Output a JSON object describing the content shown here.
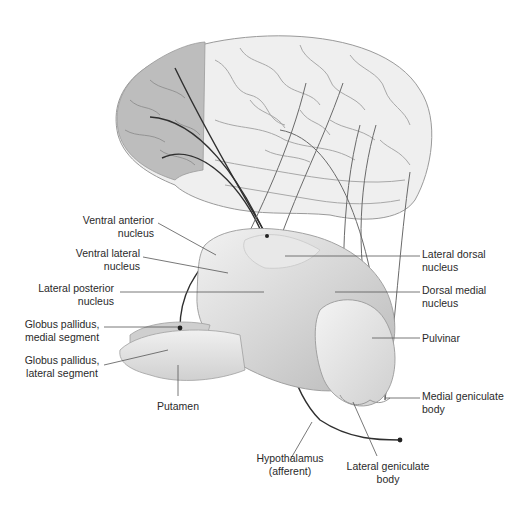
{
  "figure": {
    "structures": [
      "cerebral-cortex",
      "thalamus",
      "globus-pallidus",
      "putamen"
    ],
    "colors": {
      "background": "#ffffff",
      "cortex_light": "#efefef",
      "cortex_shaded": "#bdbdbd",
      "thalamus": "#d8d8d8",
      "leader_line": "#555555",
      "fiber": "#333333",
      "label_text": "#2a2a2a"
    }
  },
  "labels": {
    "ventral_anterior": {
      "line1": "Ventral anterior",
      "line2": "nucleus"
    },
    "ventral_lateral": {
      "line1": "Ventral lateral",
      "line2": "nucleus"
    },
    "lateral_posterior": {
      "line1": "Lateral posterior",
      "line2": "nucleus"
    },
    "gp_medial": {
      "line1": "Globus pallidus,",
      "line2": "medial segment"
    },
    "gp_lateral": {
      "line1": "Globus pallidus,",
      "line2": "lateral segment"
    },
    "putamen": {
      "line1": "Putamen"
    },
    "hypothalamus": {
      "line1": "Hypothalamus",
      "line2": "(afferent)"
    },
    "lateral_geniculate": {
      "line1": "Lateral geniculate",
      "line2": "body"
    },
    "medial_geniculate": {
      "line1": "Medial geniculate",
      "line2": "body"
    },
    "pulvinar": {
      "line1": "Pulvinar"
    },
    "dorsal_medial": {
      "line1": "Dorsal medial",
      "line2": "nucleus"
    },
    "lateral_dorsal": {
      "line1": "Lateral dorsal",
      "line2": "nucleus"
    }
  }
}
